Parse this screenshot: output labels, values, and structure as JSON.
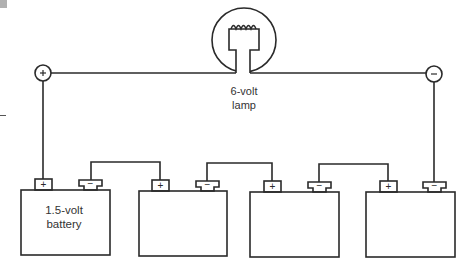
{
  "diagram": {
    "lamp": {
      "label_line1": "6-volt",
      "label_line2": "lamp"
    },
    "battery_label_line1": "1.5-volt",
    "battery_label_line2": "battery",
    "positive_symbol": "+",
    "negative_symbol": "−",
    "battery_count": 4,
    "colors": {
      "line": "#2a2a2a",
      "background": "#ffffff",
      "corner_mark": "#b0b0b0"
    }
  }
}
